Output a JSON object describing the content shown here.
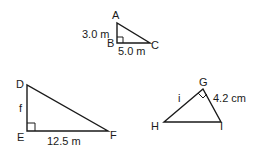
{
  "figure": {
    "triangles": [
      {
        "name": "ABC",
        "vertices": {
          "A": "A",
          "B": "B",
          "C": "C"
        },
        "right_angle_at": "B",
        "sides": {
          "AB": "3.0 m",
          "BC": "5.0 m"
        }
      },
      {
        "name": "DEF",
        "vertices": {
          "D": "D",
          "E": "E",
          "F": "F"
        },
        "right_angle_at": "E",
        "sides": {
          "DE": "f",
          "EF": "12.5 m"
        }
      },
      {
        "name": "GHI",
        "vertices": {
          "G": "G",
          "H": "H",
          "I": "I"
        },
        "right_angle_at": "G",
        "sides": {
          "HG": "i",
          "GI": "4.2 cm"
        }
      }
    ],
    "stroke_color": "#1a1a1a",
    "background": "#ffffff"
  }
}
